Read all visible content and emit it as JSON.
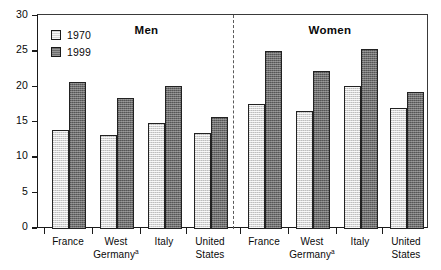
{
  "chart_data": {
    "type": "bar",
    "title": "",
    "xlabel": "",
    "ylabel": "",
    "ylim": [
      0,
      30
    ],
    "yticks": [
      0,
      5,
      10,
      15,
      20,
      25,
      30
    ],
    "ytick_labels": [
      "0",
      "5",
      "10",
      "15",
      "20",
      "25",
      "30"
    ],
    "grid": false,
    "legend_position": "upper-left inside plot",
    "panels": [
      {
        "name": "Men",
        "categories": [
          "France",
          "West Germanyᵃ",
          "Italy",
          "United States"
        ],
        "series": [
          {
            "name": "1970",
            "values": [
              14.0,
              13.3,
              15.0,
              13.5
            ]
          },
          {
            "name": "1999",
            "values": [
              20.7,
              18.5,
              20.2,
              15.8
            ]
          }
        ]
      },
      {
        "name": "Women",
        "categories": [
          "France",
          "West Germanyᵃ",
          "Italy",
          "United States"
        ],
        "series": [
          {
            "name": "1970",
            "values": [
              17.6,
              16.6,
              20.2,
              17.1
            ]
          },
          {
            "name": "1999",
            "values": [
              25.1,
              22.3,
              25.4,
              19.4
            ]
          }
        ]
      }
    ],
    "categories": [
      "France",
      "West Germanyᵃ",
      "Italy",
      "United States"
    ],
    "legend": [
      "1970",
      "1999"
    ],
    "colors": {
      "series_1970": "#d5d5d5",
      "series_1999": "#6d6d6d",
      "axis": "#1a1a1a",
      "divider": "#5a5a5a",
      "background": "#ffffff"
    },
    "annotations": [
      "dashed vertical divider separating Men and Women panels"
    ]
  },
  "axis": {
    "y_ticks": [
      {
        "label": "30",
        "value": 30
      },
      {
        "label": "25",
        "value": 25
      },
      {
        "label": "20",
        "value": 20
      },
      {
        "label": "15",
        "value": 15
      },
      {
        "label": "10",
        "value": 10
      },
      {
        "label": "5",
        "value": 5
      },
      {
        "label": "0",
        "value": 0
      }
    ]
  },
  "legend": {
    "items": [
      {
        "label": "1970",
        "swatch": "light-gray-square"
      },
      {
        "label": "1999",
        "swatch": "dark-gray-square"
      }
    ]
  },
  "panels": {
    "men": {
      "title": "Men",
      "x_labels": [
        {
          "line1": "France",
          "line2": "",
          "note": ""
        },
        {
          "line1": "West",
          "line2": "Germany",
          "note": "a"
        },
        {
          "line1": "Italy",
          "line2": "",
          "note": ""
        },
        {
          "line1": "United",
          "line2": "States",
          "note": ""
        }
      ]
    },
    "women": {
      "title": "Women",
      "x_labels": [
        {
          "line1": "France",
          "line2": "",
          "note": ""
        },
        {
          "line1": "West",
          "line2": "Germany",
          "note": "a"
        },
        {
          "line1": "Italy",
          "line2": "",
          "note": ""
        },
        {
          "line1": "United",
          "line2": "States",
          "note": ""
        }
      ]
    }
  }
}
